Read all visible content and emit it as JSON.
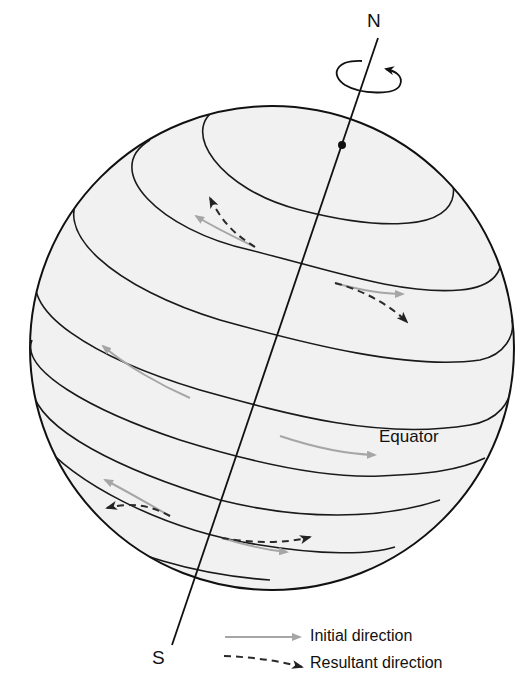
{
  "diagram": {
    "labels": {
      "north_pole": "N",
      "south_pole": "S",
      "equator": "Equator"
    },
    "legend": [
      {
        "label": "Initial direction",
        "style": "solid-gray-arrow",
        "color": "#a6a6a6"
      },
      {
        "label": "Resultant direction",
        "style": "dashed-dark-arrow",
        "color": "#2a2a2a"
      }
    ],
    "colors": {
      "globe_fill": "#f1f1f1",
      "outline": "#111111",
      "initial_arrow": "#a6a6a6",
      "resultant_arrow": "#2a2a2a"
    }
  }
}
